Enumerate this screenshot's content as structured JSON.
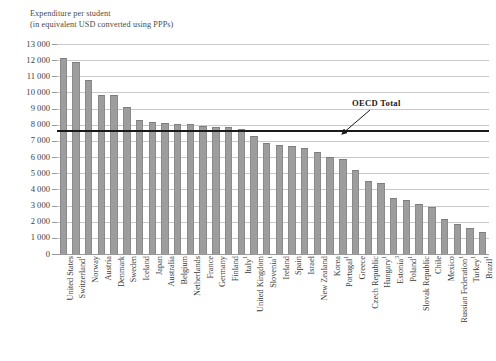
{
  "title": {
    "line1": "Expenditure per student",
    "line2": "(in equivalent USD converted using PPPs)"
  },
  "annotation": {
    "oecd_total_label": "OECD Total",
    "oecd_total_value": 7620
  },
  "axis": {
    "y_ticks": [
      "0",
      "1 000",
      "2 000",
      "3 000",
      "4 000",
      "5 000",
      "6 000",
      "7 000",
      "8 000",
      "9 000",
      "10 000",
      "11 000",
      "12 000",
      "13 000"
    ]
  },
  "colors": {
    "bar_fill": "#9d9d9d",
    "bar_stroke": "#8a8a8a",
    "gridline": "#c9c9c9",
    "oecd_line": "#1a1a1a",
    "text": "#3a3a3a",
    "background": "#ffffff"
  },
  "chart_data": {
    "type": "bar",
    "title": "Expenditure per student (in equivalent USD converted using PPPs)",
    "xlabel": "",
    "ylabel": "Expenditure per student (in equivalent USD converted using PPPs)",
    "ylim": [
      0,
      13000
    ],
    "ytick_interval": 1000,
    "grid": true,
    "legend": false,
    "orientation": "vertical",
    "sorted": "descending",
    "reference_lines": [
      {
        "name": "OECD Total",
        "value": 7620,
        "color": "#1a1a1a",
        "label_position": "top-right"
      }
    ],
    "categories": [
      "United States",
      "Switzerland¹",
      "Norway",
      "Austria",
      "Denmark",
      "Sweden",
      "Iceland",
      "Japan",
      "Australia",
      "Belgium",
      "Netherlands",
      "France",
      "Germany",
      "Finland",
      "Italy¹",
      "United Kingdom",
      "Slovenia¹",
      "Ireland",
      "Spain",
      "Israel",
      "New Zealand",
      "Korea",
      "Portugal¹",
      "Greece",
      "Czech Republic",
      "Hungary¹",
      "Estonia³",
      "Poland¹",
      "Slovak Republic",
      "Chile",
      "Mexico",
      "Russian Federation¹",
      "Turkey¹",
      "Brazil¹"
    ],
    "values": [
      12150,
      11900,
      10750,
      9830,
      9820,
      9120,
      8300,
      8150,
      8080,
      8030,
      8030,
      7920,
      7840,
      7840,
      7730,
      7320,
      6870,
      6770,
      6660,
      6580,
      6340,
      6030,
      5860,
      5180,
      4510,
      4390,
      3440,
      3370,
      3120,
      2930,
      2180,
      1840,
      1600,
      1380
    ],
    "labels": [
      {
        "name": "United States",
        "value": 12150,
        "footnote": ""
      },
      {
        "name": "Switzerland",
        "value": 11900,
        "footnote": "1"
      },
      {
        "name": "Norway",
        "value": 10750,
        "footnote": ""
      },
      {
        "name": "Austria",
        "value": 9830,
        "footnote": ""
      },
      {
        "name": "Denmark",
        "value": 9820,
        "footnote": ""
      },
      {
        "name": "Sweden",
        "value": 9120,
        "footnote": ""
      },
      {
        "name": "Iceland",
        "value": 8300,
        "footnote": ""
      },
      {
        "name": "Japan",
        "value": 8150,
        "footnote": ""
      },
      {
        "name": "Australia",
        "value": 8080,
        "footnote": ""
      },
      {
        "name": "Belgium",
        "value": 8030,
        "footnote": ""
      },
      {
        "name": "Netherlands",
        "value": 8030,
        "footnote": ""
      },
      {
        "name": "France",
        "value": 7920,
        "footnote": ""
      },
      {
        "name": "Germany",
        "value": 7840,
        "footnote": ""
      },
      {
        "name": "Finland",
        "value": 7840,
        "footnote": ""
      },
      {
        "name": "Italy",
        "value": 7730,
        "footnote": "1"
      },
      {
        "name": "United Kingdom",
        "value": 7320,
        "footnote": ""
      },
      {
        "name": "Slovenia",
        "value": 6870,
        "footnote": "1"
      },
      {
        "name": "Ireland",
        "value": 6770,
        "footnote": ""
      },
      {
        "name": "Spain",
        "value": 6660,
        "footnote": ""
      },
      {
        "name": "Israel",
        "value": 6580,
        "footnote": ""
      },
      {
        "name": "New Zealand",
        "value": 6340,
        "footnote": ""
      },
      {
        "name": "Korea",
        "value": 6030,
        "footnote": ""
      },
      {
        "name": "Portugal",
        "value": 5860,
        "footnote": "1"
      },
      {
        "name": "Greece",
        "value": 5180,
        "footnote": ""
      },
      {
        "name": "Czech Republic",
        "value": 4510,
        "footnote": ""
      },
      {
        "name": "Hungary",
        "value": 4390,
        "footnote": "1"
      },
      {
        "name": "Estonia",
        "value": 3440,
        "footnote": "3"
      },
      {
        "name": "Poland",
        "value": 3370,
        "footnote": "1"
      },
      {
        "name": "Slovak Republic",
        "value": 3120,
        "footnote": ""
      },
      {
        "name": "Chile",
        "value": 2930,
        "footnote": ""
      },
      {
        "name": "Mexico",
        "value": 2180,
        "footnote": ""
      },
      {
        "name": "Russian Federation",
        "value": 1840,
        "footnote": "1"
      },
      {
        "name": "Turkey",
        "value": 1600,
        "footnote": "1"
      },
      {
        "name": "Brazil",
        "value": 1380,
        "footnote": "1"
      }
    ]
  }
}
